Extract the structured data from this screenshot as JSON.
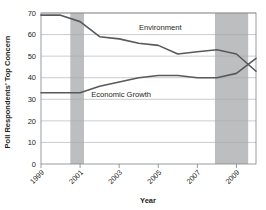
{
  "chart_data": {
    "type": "line",
    "title": "",
    "xlabel": "Year",
    "ylabel": "Poll Respondents' Top Concern",
    "xlim": [
      1999,
      2010
    ],
    "ylim": [
      0,
      70
    ],
    "yticks": [
      0,
      10,
      20,
      30,
      40,
      50,
      60,
      70
    ],
    "xticks": [
      1999,
      2001,
      2003,
      2005,
      2007,
      2009
    ],
    "xtick_labels": [
      "1999",
      "2001",
      "2003",
      "2005",
      "2007",
      "2009"
    ],
    "ytick_labels": [
      "0",
      "10",
      "20",
      "30",
      "40",
      "50",
      "60",
      "70"
    ],
    "grid": true,
    "grid_axis": "y",
    "legend_position": "inline-annotations",
    "x": [
      1999,
      2000,
      2001,
      2002,
      2003,
      2004,
      2005,
      2006,
      2007,
      2008,
      2009,
      2010
    ],
    "series": [
      {
        "name": "Environment",
        "label": "Environment",
        "color": "#58595b",
        "values": [
          69,
          69,
          66,
          59,
          58,
          56,
          55,
          51,
          52,
          53,
          51,
          43
        ]
      },
      {
        "name": "Economic Growth",
        "label": "Economic Growth",
        "color": "#58595b",
        "values": [
          33,
          33,
          33,
          36,
          38,
          40,
          41,
          41,
          40,
          40,
          42,
          49
        ]
      }
    ],
    "shaded_bands": [
      {
        "name": "recession-band-2001",
        "x0": 2000.5,
        "x1": 2001.2,
        "color": "#bcbec0"
      },
      {
        "name": "recession-band-2008",
        "x0": 2007.9,
        "x1": 2009.6,
        "color": "#bcbec0"
      }
    ],
    "annotations": [
      {
        "name": "environment-label",
        "text": "Environment",
        "x": 2005.1,
        "y": 62
      },
      {
        "name": "economic-growth-label",
        "text": "Economic Growth",
        "x": 2003.1,
        "y": 31
      }
    ]
  },
  "axes": {
    "x_axis_title": "Year",
    "y_axis_title": "Poll Respondents' Top Concern"
  }
}
